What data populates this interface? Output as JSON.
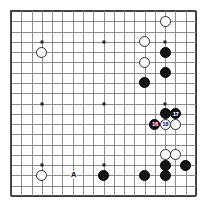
{
  "figure": {
    "kind": "go-board-diagram",
    "board_size": 19,
    "title": "",
    "colors": {
      "background": "#ffffff",
      "grid": "#8d8d8d",
      "grid_edge": "#3d3d3d",
      "frame": "#4a4a4a",
      "black_stone": "#141414",
      "white_stone": "#ffffff",
      "stone_outline": "#2a2a2a",
      "star_point": "#222222",
      "label_text": "#111111"
    },
    "geometry": {
      "origin_x": 11,
      "origin_y": 11,
      "spacing": 10.28,
      "stone_diameter": 11,
      "frame_left": 10,
      "frame_top": 10,
      "frame_size": 186
    }
  },
  "chart_data": {
    "type": "table",
    "board_size": 19,
    "star_points": [
      {
        "col": 4,
        "row": 4
      },
      {
        "col": 10,
        "row": 4
      },
      {
        "col": 16,
        "row": 4
      },
      {
        "col": 4,
        "row": 10
      },
      {
        "col": 10,
        "row": 10
      },
      {
        "col": 16,
        "row": 10
      },
      {
        "col": 4,
        "row": 16
      },
      {
        "col": 10,
        "row": 16
      },
      {
        "col": 16,
        "row": 16
      }
    ],
    "stones": [
      {
        "color": "white",
        "col": 16,
        "row": 2,
        "number": ""
      },
      {
        "color": "white",
        "col": 14,
        "row": 4,
        "number": ""
      },
      {
        "color": "white",
        "col": 14,
        "row": 6,
        "number": ""
      },
      {
        "color": "white",
        "col": 4,
        "row": 5,
        "number": ""
      },
      {
        "color": "black",
        "col": 16,
        "row": 5,
        "number": ""
      },
      {
        "color": "black",
        "col": 16,
        "row": 7,
        "number": ""
      },
      {
        "color": "black",
        "col": 14,
        "row": 8,
        "number": ""
      },
      {
        "color": "black",
        "col": 16,
        "row": 11,
        "number": ""
      },
      {
        "color": "black",
        "col": 17,
        "row": 11,
        "number": "17"
      },
      {
        "color": "black",
        "col": 15,
        "row": 12,
        "number": "16"
      },
      {
        "color": "white",
        "col": 16,
        "row": 12,
        "number": "18"
      },
      {
        "color": "white",
        "col": 17,
        "row": 12,
        "number": ""
      },
      {
        "color": "white",
        "col": 16,
        "row": 15,
        "number": ""
      },
      {
        "color": "white",
        "col": 17,
        "row": 15,
        "number": ""
      },
      {
        "color": "black",
        "col": 16,
        "row": 16,
        "number": ""
      },
      {
        "color": "black",
        "col": 18,
        "row": 16,
        "number": ""
      },
      {
        "color": "white",
        "col": 4,
        "row": 17,
        "number": ""
      },
      {
        "color": "black",
        "col": 10,
        "row": 17,
        "number": ""
      },
      {
        "color": "black",
        "col": 14,
        "row": 17,
        "number": ""
      },
      {
        "color": "black",
        "col": 16,
        "row": 17,
        "number": ""
      }
    ],
    "point_labels": [
      {
        "text": "A",
        "col": 7,
        "row": 17
      }
    ]
  }
}
